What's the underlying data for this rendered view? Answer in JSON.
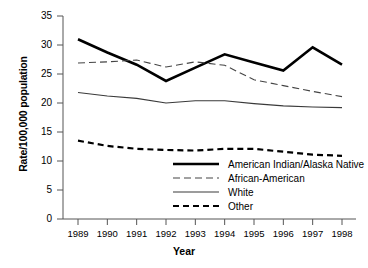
{
  "chart_data": {
    "type": "line",
    "title": "",
    "xlabel": "Year",
    "ylabel": "Rate/100,000 population",
    "x": [
      1989,
      1990,
      1991,
      1992,
      1993,
      1994,
      1995,
      1996,
      1997,
      1998
    ],
    "categories": [
      "1989",
      "1990",
      "1991",
      "1992",
      "1993",
      "1994",
      "1995",
      "1996",
      "1997",
      "1998"
    ],
    "xlim": [
      1989,
      1998
    ],
    "ylim": [
      0,
      35
    ],
    "yticks": [
      0,
      5,
      10,
      15,
      20,
      25,
      30,
      35
    ],
    "ytick_labels": [
      "0",
      "5",
      "10",
      "15",
      "20",
      "25",
      "30",
      "35"
    ],
    "grid": false,
    "legend_position": "center-right-inside",
    "series": [
      {
        "name": "American Indian/Alaska Native",
        "style": "thick-solid",
        "color": "#000000",
        "values": [
          31.0,
          28.7,
          26.6,
          23.8,
          26.1,
          28.4,
          27.0,
          25.6,
          29.6,
          26.6
        ]
      },
      {
        "name": "African-American",
        "style": "long-dash",
        "color": "#444444",
        "values": [
          26.9,
          27.1,
          27.4,
          26.2,
          27.1,
          26.5,
          24.0,
          23.0,
          22.0,
          21.1
        ]
      },
      {
        "name": "White",
        "style": "thin-solid",
        "color": "#3a3a3a",
        "values": [
          21.8,
          21.2,
          20.8,
          20.0,
          20.4,
          20.4,
          19.9,
          19.5,
          19.3,
          19.2
        ]
      },
      {
        "name": "Other",
        "style": "bold-dash",
        "color": "#000000",
        "values": [
          13.5,
          12.6,
          12.1,
          11.9,
          11.8,
          12.1,
          12.1,
          11.6,
          11.1,
          10.9
        ]
      }
    ]
  },
  "legend": {
    "items": [
      {
        "label": "American Indian/Alaska Native",
        "sample": "thick-solid-sample"
      },
      {
        "label": "African-American",
        "sample": "long-dash-sample"
      },
      {
        "label": "White",
        "sample": "thin-solid-sample"
      },
      {
        "label": "Other",
        "sample": "bold-dash-sample"
      }
    ]
  }
}
